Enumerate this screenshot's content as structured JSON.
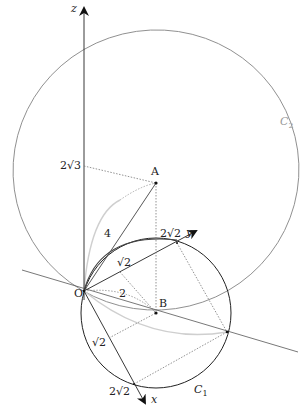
{
  "diagram": {
    "type": "3D geometry figure",
    "axes": {
      "x": {
        "label": "x"
      },
      "y": {
        "label": "y"
      },
      "z": {
        "label": "z"
      }
    },
    "points": {
      "origin": {
        "label": "O"
      },
      "A": {
        "label": "A"
      },
      "B": {
        "label": "B"
      }
    },
    "curves": {
      "C1": {
        "label": "C",
        "subscript": "1"
      },
      "C2": {
        "label": "C",
        "subscript": "2"
      }
    },
    "measurements": {
      "z_height": "2√3",
      "OA_length": "4",
      "OB_length": "2",
      "y_radius_inner": "√2",
      "y_intercept": "2√2",
      "x_radius_inner": "√2",
      "x_intercept": "2√2"
    },
    "colors": {
      "axis": "#222222",
      "circle_C1": "#333333",
      "ellipse_C2": "#8a8a8a",
      "dotted": "#777777",
      "light_arc": "#c8c8c8"
    }
  }
}
